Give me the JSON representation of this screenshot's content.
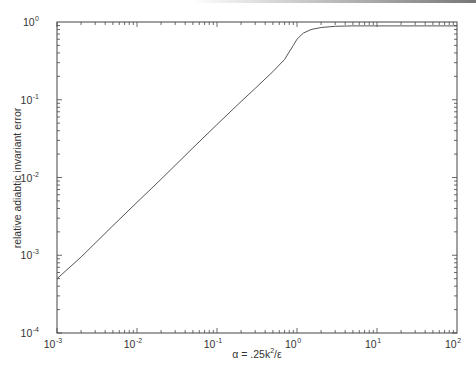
{
  "chart_data": {
    "type": "line",
    "title": "",
    "xlabel": "α = .25k²/ε",
    "ylabel": "relative adiabtic invariant error",
    "xscale": "log",
    "yscale": "log",
    "xlim": [
      0.001,
      100
    ],
    "ylim": [
      0.0001,
      1
    ],
    "grid": false,
    "legend": null,
    "x_ticks": [
      "10^-3",
      "10^-2",
      "10^-1",
      "10^0",
      "10^1",
      "10^2"
    ],
    "y_ticks": [
      "10^-4",
      "10^-3",
      "10^-2",
      "10^-1",
      "10^0"
    ],
    "series": [
      {
        "name": "error",
        "color": "#555555",
        "x": [
          0.001,
          0.002,
          0.005,
          0.01,
          0.02,
          0.05,
          0.1,
          0.2,
          0.3,
          0.5,
          0.7,
          0.9,
          1.0,
          1.2,
          1.5,
          2,
          3,
          5,
          10,
          20,
          50,
          100
        ],
        "y": [
          0.0005,
          0.00095,
          0.0024,
          0.0048,
          0.0095,
          0.024,
          0.048,
          0.095,
          0.14,
          0.23,
          0.33,
          0.5,
          0.6,
          0.72,
          0.8,
          0.85,
          0.88,
          0.89,
          0.89,
          0.89,
          0.89,
          0.89
        ]
      }
    ]
  },
  "labels": {
    "x_axis": {
      "alpha": "α",
      "rest": " = .25k",
      "sup": "2",
      "tail": "/ε"
    },
    "y_axis": "relative adiabtic invariant error",
    "x_ticks": [
      {
        "base": "10",
        "exp": "-3"
      },
      {
        "base": "10",
        "exp": "-2"
      },
      {
        "base": "10",
        "exp": "-1"
      },
      {
        "base": "10",
        "exp": "0"
      },
      {
        "base": "10",
        "exp": "1"
      },
      {
        "base": "10",
        "exp": "2"
      }
    ],
    "y_ticks": [
      {
        "base": "10",
        "exp": "0"
      },
      {
        "base": "10",
        "exp": "-1"
      },
      {
        "base": "10",
        "exp": "-2"
      },
      {
        "base": "10",
        "exp": "-3"
      },
      {
        "base": "10",
        "exp": "-4"
      }
    ]
  }
}
